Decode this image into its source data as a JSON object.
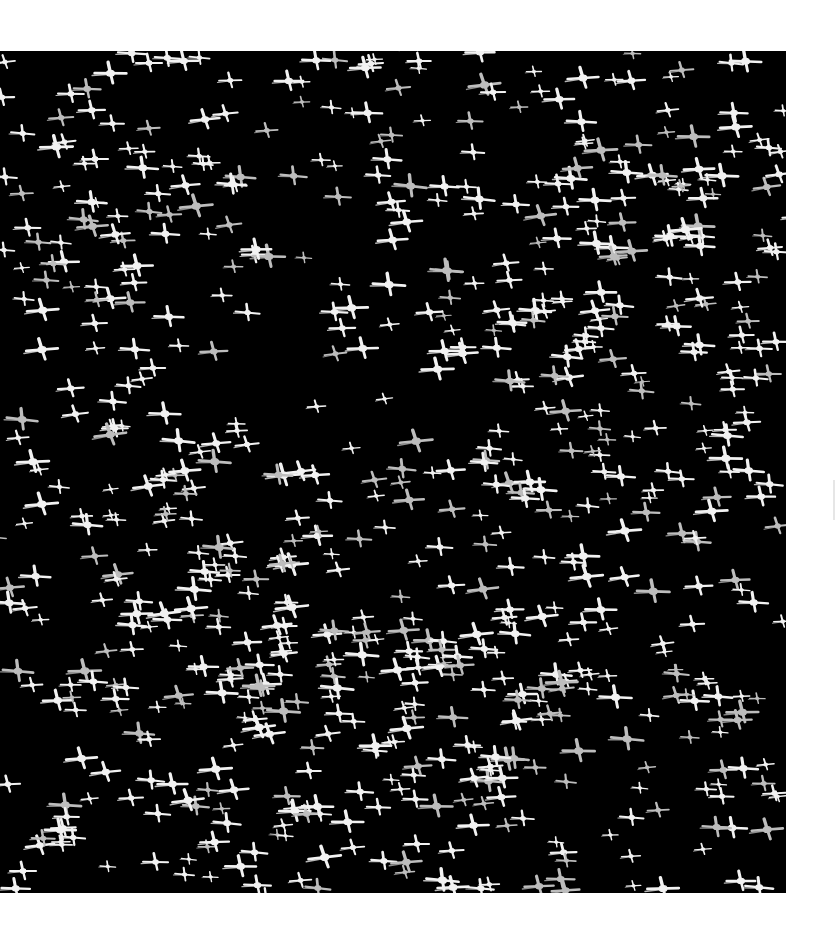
{
  "image": {
    "subject": "Flock of flamingos in flight seen from above against a black background",
    "background_color": "#ffffff",
    "photo_background_color": "#000000",
    "bird_color": "#f2f2f2",
    "bird_shadow_color": "#bdbdbd",
    "photo_box": {
      "left": 0,
      "top": 51,
      "width": 786,
      "height": 842
    }
  },
  "flock": {
    "count": 720,
    "seed": 1337,
    "min_scale": 0.55,
    "max_scale": 1.25,
    "density_clusters": [
      {
        "x": 120,
        "y": 180,
        "r": 160,
        "weight": 1.0
      },
      {
        "x": 520,
        "y": 80,
        "r": 200,
        "weight": 1.1
      },
      {
        "x": 640,
        "y": 360,
        "r": 170,
        "weight": 1.0
      },
      {
        "x": 160,
        "y": 520,
        "r": 200,
        "weight": 1.3
      },
      {
        "x": 430,
        "y": 560,
        "r": 180,
        "weight": 1.0
      },
      {
        "x": 300,
        "y": 720,
        "r": 200,
        "weight": 1.2
      },
      {
        "x": 620,
        "y": 720,
        "r": 170,
        "weight": 1.0
      },
      {
        "x": 720,
        "y": 160,
        "r": 120,
        "weight": 0.8
      }
    ],
    "sample_birds": [
      {
        "x": 150,
        "y": 12,
        "s": 1.0
      },
      {
        "x": 290,
        "y": 30,
        "s": 1.1
      },
      {
        "x": 420,
        "y": 10,
        "s": 0.9
      },
      {
        "x": 96,
        "y": 108,
        "s": 1.0
      },
      {
        "x": 296,
        "y": 760,
        "s": 1.2
      },
      {
        "x": 310,
        "y": 720,
        "s": 0.9
      },
      {
        "x": 742,
        "y": 830,
        "s": 1.1
      },
      {
        "x": 24,
        "y": 820,
        "s": 1.0
      }
    ]
  }
}
